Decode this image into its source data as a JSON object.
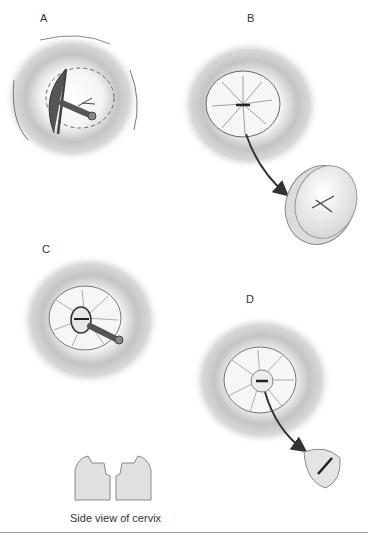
{
  "figure": {
    "panels": [
      {
        "id": "A",
        "label": "A",
        "description": "Cervix with cone biopsy knife/blade rotating around os, dashed circle marking excision margin"
      },
      {
        "id": "B",
        "label": "B",
        "description": "Cervix after incision with radial folds; arrow to removed cone disc specimen"
      },
      {
        "id": "C",
        "label": "C",
        "description": "Smaller central excision with probe instrument"
      },
      {
        "id": "D",
        "label": "D",
        "description": "Central plug excised; arrow to small cylindrical specimen"
      }
    ],
    "caption": "Side view of cervix",
    "colors": {
      "tissue_shadow": "#b8b8b8",
      "tissue_light": "#f2f2f2",
      "outline": "#555555",
      "instrument": "#7a7a7a",
      "arrow": "#333333",
      "side_view_fill": "#e2e2e2"
    }
  }
}
